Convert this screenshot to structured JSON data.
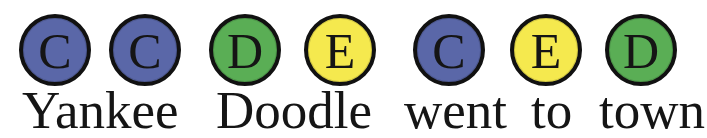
{
  "notes": [
    {
      "letter": "C",
      "color": "#5a67a8",
      "left": 19
    },
    {
      "letter": "C",
      "color": "#5a67a8",
      "left": 109
    },
    {
      "letter": "D",
      "color": "#5aae55",
      "left": 209
    },
    {
      "letter": "E",
      "color": "#f5e94e",
      "left": 304
    },
    {
      "letter": "C",
      "color": "#5a67a8",
      "left": 413
    },
    {
      "letter": "E",
      "color": "#f5e94e",
      "left": 510
    },
    {
      "letter": "D",
      "color": "#5aae55",
      "left": 605
    }
  ],
  "lyrics": [
    {
      "word": "Yankee",
      "left": 22
    },
    {
      "word": "Doodle",
      "left": 216
    },
    {
      "word": "went",
      "left": 404
    },
    {
      "word": "to",
      "left": 531
    },
    {
      "word": "town",
      "left": 599
    }
  ],
  "legend_colors": {
    "C": "#5a67a8",
    "D": "#5aae55",
    "E": "#f5e94e"
  }
}
